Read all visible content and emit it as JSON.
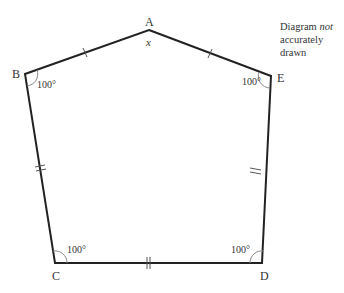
{
  "header_fragment": "(cut-off text line at top of page)",
  "note": {
    "line1_prefix": "Diagram ",
    "line1_emph": "not",
    "line2": "accurately drawn"
  },
  "vertices": {
    "A": {
      "label": "A",
      "x": 149,
      "y": 30
    },
    "B": {
      "label": "B",
      "x": 25,
      "y": 74
    },
    "C": {
      "label": "C",
      "x": 55,
      "y": 263
    },
    "D": {
      "label": "D",
      "x": 262,
      "y": 263
    },
    "E": {
      "label": "E",
      "x": 271,
      "y": 76
    }
  },
  "angles": {
    "A": "x",
    "B": "100°",
    "C": "100°",
    "D": "100°",
    "E": "100°"
  },
  "tick_marks": {
    "AB": 1,
    "AE": 1,
    "BC": 2,
    "CD": 2,
    "DE": 2
  },
  "colors": {
    "line": "#222222",
    "arc": "#888888",
    "text": "#333333"
  }
}
